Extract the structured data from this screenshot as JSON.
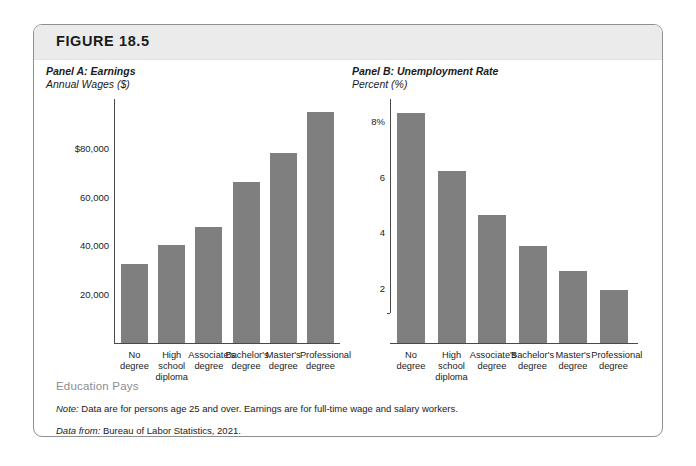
{
  "figure": {
    "label": "FIGURE 18.5",
    "footer_heading": "Education Pays",
    "note_lead": "Note:",
    "note_text": " Data are for persons age 25 and over. Earnings are for full-time wage and salary workers.",
    "source_lead": "Data from:",
    "source_text": " Bureau of Labor Statistics, 2021."
  },
  "colors": {
    "bar": "#7f7f7f",
    "axis": "#4a4a4a",
    "header_band": "#ebebeb",
    "card_border": "#8d8f91",
    "footer_heading": "#8b8d8f"
  },
  "chart_data": [
    {
      "type": "bar",
      "panel_id": "A",
      "title": "Panel A: Earnings",
      "subtitle": "Annual Wages ($)",
      "xlabel": "",
      "ylabel": "Annual Wages ($)",
      "categories": [
        "No\ndegree",
        "High\nschool\ndiploma",
        "Associate's\ndegree",
        "Bachelor's\ndegree",
        "Master's\ndegree",
        "Professional\ndegree"
      ],
      "values": [
        32400,
        40000,
        47500,
        65800,
        78000,
        94500
      ],
      "ylim": [
        0,
        100000
      ],
      "yticks": [
        20000,
        40000,
        60000,
        80000
      ],
      "ytick_labels": [
        "20,000",
        "40,000",
        "60,000",
        "$80,000"
      ],
      "grid": false,
      "legend": "none"
    },
    {
      "type": "bar",
      "panel_id": "B",
      "title": "Panel B: Unemployment Rate",
      "subtitle": "Percent (%)",
      "xlabel": "",
      "ylabel": "Percent (%)",
      "categories": [
        "No\ndegree",
        "High\nschool\ndiploma",
        "Associate's\ndegree",
        "Bachelor's\ndegree",
        "Master's\ndegree",
        "Professional\ndegree"
      ],
      "values": [
        8.3,
        6.2,
        4.6,
        3.5,
        2.6,
        1.9
      ],
      "ylim": [
        0,
        8.8
      ],
      "yticks": [
        2,
        4,
        6,
        8
      ],
      "ytick_labels": [
        "2",
        "4",
        "6",
        "8%"
      ],
      "grid": false,
      "legend": "none"
    }
  ]
}
